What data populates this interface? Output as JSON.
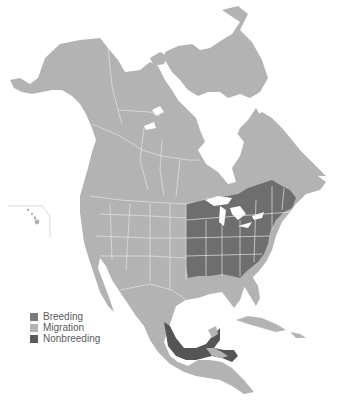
{
  "map": {
    "title": "Range map — North America",
    "region": "North and Central America",
    "colors": {
      "background": "#ffffff",
      "migration": "#b3b3b3",
      "breeding": "#7a7a7a",
      "nonbreeding": "#5c5c5c",
      "borders": "#e4e4e4",
      "water": "#ffffff"
    }
  },
  "legend": {
    "items": [
      {
        "label": "Breeding",
        "color": "#7a7a7a"
      },
      {
        "label": "Migration",
        "color": "#b3b3b3"
      },
      {
        "label": "Nonbreeding",
        "color": "#5c5c5c"
      }
    ]
  }
}
